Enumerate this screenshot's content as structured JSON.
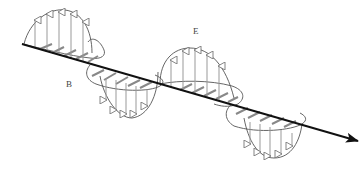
{
  "diagram": {
    "type": "electromagnetic-wave",
    "labels": {
      "electric_field": "E",
      "magnetic_field": "B"
    },
    "colors": {
      "axis": "#111111",
      "outline": "#555555",
      "arrow": "#9a9a9a",
      "background": "#ffffff"
    },
    "axis": {
      "start": [
        22,
        44
      ],
      "end": [
        358,
        141
      ]
    },
    "e_lobes": [
      {
        "from": 22,
        "to": 120,
        "direction": "up",
        "amplitude": 40,
        "arrows": 5
      },
      {
        "from": 120,
        "to": 225,
        "direction": "down",
        "amplitude": 42,
        "arrows": 5
      },
      {
        "from": 160,
        "to": 255,
        "direction": "up",
        "amplitude": 44,
        "arrows": 5
      },
      {
        "from": 225,
        "to": 330,
        "direction": "down",
        "amplitude": 40,
        "arrows": 5
      }
    ],
    "b_lobes": [
      {
        "from": 22,
        "to": 105,
        "side": "front"
      },
      {
        "from": 88,
        "to": 165,
        "side": "back"
      },
      {
        "from": 160,
        "to": 245,
        "side": "front"
      },
      {
        "from": 228,
        "to": 310,
        "side": "back"
      }
    ]
  }
}
